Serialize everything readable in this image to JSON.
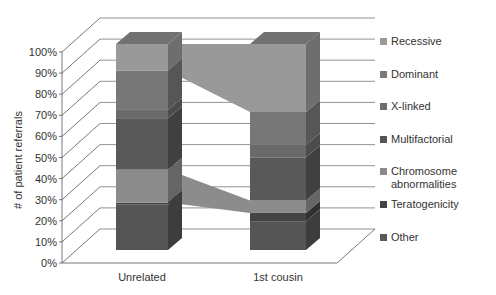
{
  "chart_data": {
    "type": "bar",
    "subtype": "3d-stacked-100-percent",
    "title": "",
    "xlabel": "",
    "ylabel": "# of patient referrals",
    "ylim": [
      0,
      100
    ],
    "yticks": [
      "0%",
      "10%",
      "20%",
      "30%",
      "40%",
      "50%",
      "60%",
      "70%",
      "80%",
      "90%",
      "100%"
    ],
    "grid": true,
    "legend_position": "right",
    "categories": [
      "Unrelated",
      "1st cousin"
    ],
    "series": [
      {
        "name": "Other",
        "color": "#555555",
        "values": [
          22,
          14
        ]
      },
      {
        "name": "Teratogenicity",
        "color": "#444444",
        "values": [
          1,
          4
        ]
      },
      {
        "name": "Chromosome abnormalities",
        "color": "#8c8c8c",
        "values": [
          16,
          6
        ]
      },
      {
        "name": "Multifactorial",
        "color": "#595959",
        "values": [
          25,
          21
        ]
      },
      {
        "name": "X-linked",
        "color": "#6a6a6a",
        "values": [
          4,
          6
        ]
      },
      {
        "name": "Dominant",
        "color": "#777777",
        "values": [
          19,
          16
        ]
      },
      {
        "name": "Recessive",
        "color": "#999999",
        "values": [
          13,
          33
        ]
      }
    ],
    "connector_series": [
      "Recessive",
      "Chromosome abnormalities"
    ]
  },
  "legend": {
    "items": [
      {
        "label": "Recessive",
        "color": "#999999",
        "top": 7
      },
      {
        "label": "Dominant",
        "color": "#7a7a7a",
        "top": 40
      },
      {
        "label": "X-linked",
        "color": "#6e6e6e",
        "top": 72
      },
      {
        "label": "Multifactorial",
        "color": "#555555",
        "top": 105
      },
      {
        "label": "Chromosome abnormalities",
        "color": "#8a8a8a",
        "top": 137
      },
      {
        "label": "Teratogenicity",
        "color": "#444444",
        "top": 170
      },
      {
        "label": "Other",
        "color": "#5a5a5a",
        "top": 203
      }
    ]
  }
}
